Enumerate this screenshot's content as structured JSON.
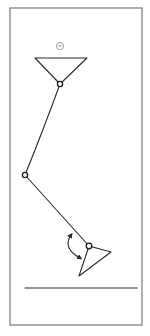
{
  "diagram": {
    "type": "linkage-mechanism-sketch",
    "symbol": {
      "name": "circled-minus",
      "glyph": "⊖",
      "x": 60,
      "y": 46
    },
    "frame": {
      "x": 10,
      "y": 8,
      "width": 132,
      "height": 317
    },
    "top_triangle": {
      "points": [
        [
          35,
          58
        ],
        [
          87,
          58
        ],
        [
          60,
          84
        ]
      ]
    },
    "joints": [
      {
        "name": "upper-joint",
        "x": 60,
        "y": 84
      },
      {
        "name": "middle-joint",
        "x": 25,
        "y": 175
      },
      {
        "name": "lower-joint",
        "x": 89,
        "y": 246
      }
    ],
    "links": [
      {
        "from": [
          60,
          84
        ],
        "to": [
          25,
          175
        ],
        "curve": true
      },
      {
        "from": [
          25,
          175
        ],
        "to": [
          89,
          246
        ],
        "curve": false
      }
    ],
    "bottom_triangle": {
      "points": [
        [
          89,
          246
        ],
        [
          111,
          252
        ],
        [
          79,
          276
        ]
      ]
    },
    "rotation_arrow": {
      "start": [
        71,
        235
      ],
      "end": [
        80,
        258
      ],
      "bidirectional": true
    },
    "ground_line": {
      "x1": 25,
      "y1": 288,
      "x2": 137,
      "y2": 288
    },
    "colors": {
      "ink": "#2a2a2a",
      "frame": "#8a8a8a",
      "background": "#ffffff"
    }
  }
}
